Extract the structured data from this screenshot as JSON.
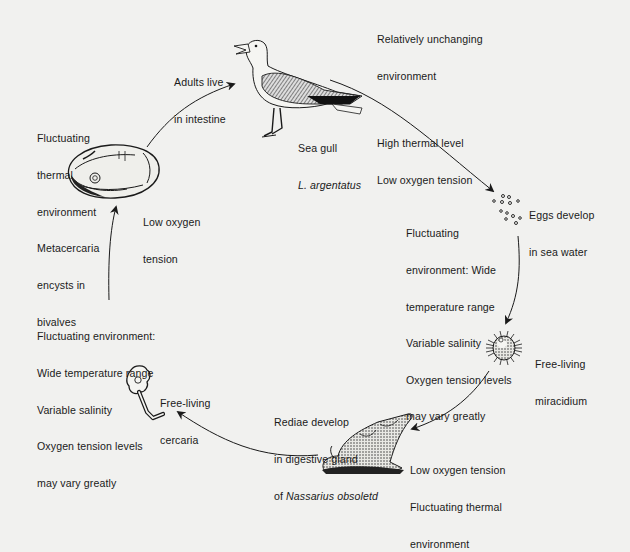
{
  "diagram": {
    "stages": [
      {
        "id": "adult",
        "label_lines": [
          "Adults live",
          "in intestine"
        ],
        "host": {
          "common": "Sea gull",
          "scientific": "L. argentatus"
        },
        "environment_lines": [
          "Relatively unchanging",
          "environment"
        ],
        "environment_lines_2": [
          "High thermal level",
          "Low oxygen tension"
        ],
        "icon": "sea-gull"
      },
      {
        "id": "eggs",
        "label_lines": [
          "Eggs develop",
          "in sea water"
        ],
        "environment_lines": [
          "Fluctuating",
          "environment: Wide",
          "temperature range",
          "Variable salinity",
          "Oxygen tension levels",
          "may vary greatly"
        ],
        "icon": "eggs"
      },
      {
        "id": "miracidium",
        "label_lines": [
          "Free-living",
          "miracidium"
        ],
        "icon": "miracidium"
      },
      {
        "id": "rediae",
        "label_lines": [
          "Rediae develop",
          "in digestive gland",
          "of "
        ],
        "label_italic": "Nassarius obsoletd",
        "environment_lines": [
          "Low oxygen tension",
          "Fluctuating thermal",
          "environment"
        ],
        "icon": "snail"
      },
      {
        "id": "cercaria",
        "label_lines": [
          "Free-living",
          "cercaria"
        ],
        "environment_lines": [
          "Fluctuating environment:",
          "Wide temperature range",
          "Variable salinity",
          "Oxygen tension levels",
          "may vary greatly"
        ],
        "icon": "cercaria"
      },
      {
        "id": "metacercaria",
        "label_lines": [
          "Metacercaria",
          "encysts in",
          "bivalves"
        ],
        "environment_lines": [
          "Fluctuating",
          "thermal",
          "environment"
        ],
        "environment_lines_2": [
          "Low oxygen",
          "tension"
        ],
        "icon": "bivalve"
      }
    ],
    "colors": {
      "background": "#f1f1ef",
      "ink": "#1a1a1a"
    }
  }
}
